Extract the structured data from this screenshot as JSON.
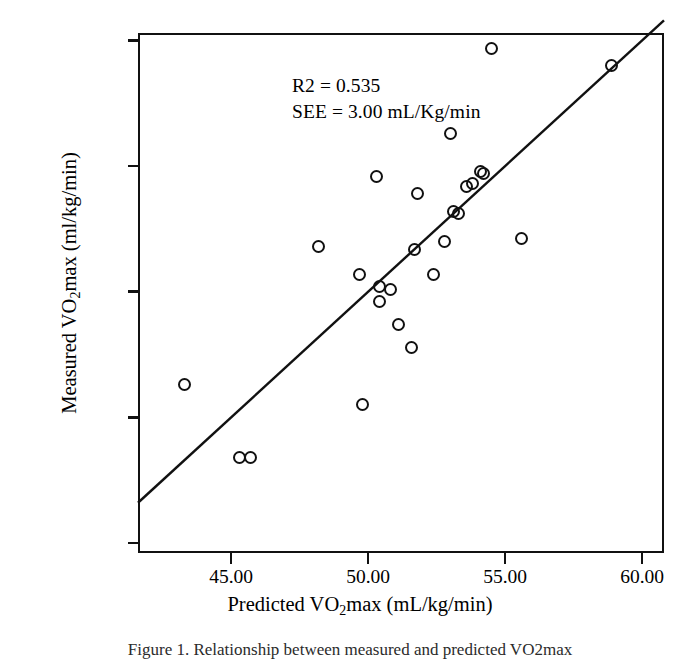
{
  "figure": {
    "caption": "Figure 1. Relationship between measured and predicted VO2max"
  },
  "annotation": {
    "r2": "R2 = 0.535",
    "see": "SEE = 3.00 mL/Kg/min"
  },
  "axes": {
    "x_title_pre": "Predicted VO",
    "x_title_sub": "2",
    "x_title_post": "max (mL/kg/min)",
    "y_title_pre": "Measured VO",
    "y_title_sub": "2",
    "y_title_post": "max (ml/kg/min)",
    "x_ticks": [
      "45.00",
      "50.00",
      "55.00",
      "60.00"
    ],
    "y_ticks": [
      "60.00",
      "55.00",
      "50.00",
      "45.00",
      "40.00"
    ]
  },
  "chart_data": {
    "type": "scatter",
    "title": "",
    "xlabel": "Predicted VO2max (mL/kg/min)",
    "ylabel": "Measured VO2max (ml/kg/min)",
    "xlim": [
      41.6,
      60.8
    ],
    "ylim": [
      39.6,
      60.3
    ],
    "xticks": [
      45.0,
      50.0,
      55.0,
      60.0
    ],
    "yticks": [
      40.0,
      45.0,
      50.0,
      55.0,
      60.0
    ],
    "grid": false,
    "legend": null,
    "annotations": [
      {
        "text": "R2 = 0.535",
        "x": 42.2,
        "y": 59.8
      },
      {
        "text": "SEE = 3.00 mL/Kg/min",
        "x": 42.2,
        "y": 58.8
      }
    ],
    "statistics": {
      "r_squared": 0.535,
      "see": 3.0,
      "see_units": "mL/Kg/min",
      "n": 26
    },
    "reference_line": {
      "type": "identity",
      "label": "line of identity",
      "x_start": 41.6,
      "y_start": 41.6,
      "x_end": 60.8,
      "y_end": 60.8
    },
    "points": [
      {
        "x": 43.3,
        "y": 46.3
      },
      {
        "x": 45.3,
        "y": 43.4
      },
      {
        "x": 45.7,
        "y": 43.4
      },
      {
        "x": 48.2,
        "y": 51.8
      },
      {
        "x": 49.7,
        "y": 50.7
      },
      {
        "x": 49.8,
        "y": 45.5
      },
      {
        "x": 50.3,
        "y": 54.6
      },
      {
        "x": 50.4,
        "y": 50.2
      },
      {
        "x": 50.4,
        "y": 49.6
      },
      {
        "x": 50.8,
        "y": 50.1
      },
      {
        "x": 51.1,
        "y": 48.7
      },
      {
        "x": 51.6,
        "y": 47.8
      },
      {
        "x": 51.7,
        "y": 51.7
      },
      {
        "x": 51.8,
        "y": 53.9
      },
      {
        "x": 52.4,
        "y": 50.7
      },
      {
        "x": 52.8,
        "y": 52.0
      },
      {
        "x": 53.0,
        "y": 56.3
      },
      {
        "x": 53.1,
        "y": 53.2
      },
      {
        "x": 53.3,
        "y": 53.1
      },
      {
        "x": 53.6,
        "y": 54.2
      },
      {
        "x": 53.8,
        "y": 54.3
      },
      {
        "x": 54.1,
        "y": 54.8
      },
      {
        "x": 54.2,
        "y": 54.7
      },
      {
        "x": 54.5,
        "y": 59.7
      },
      {
        "x": 55.6,
        "y": 52.1
      },
      {
        "x": 58.9,
        "y": 59.0
      }
    ]
  }
}
